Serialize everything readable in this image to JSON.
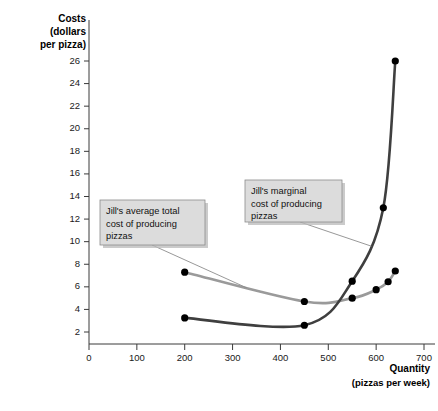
{
  "chart_data": {
    "type": "line",
    "title": "",
    "ylabel": "Costs (dollars per pizza)",
    "ylabel_lines": [
      "Costs",
      "(dollars",
      "per pizza)"
    ],
    "xlabel": "Quantity (pizzas per week)",
    "xlabel_lines": [
      "Quantity",
      "(pizzas per week)"
    ],
    "xlim": [
      0,
      700
    ],
    "ylim": [
      0,
      27
    ],
    "xticks": [
      0,
      100,
      200,
      300,
      400,
      500,
      600,
      700
    ],
    "yticks": [
      2,
      4,
      6,
      8,
      10,
      12,
      14,
      16,
      18,
      20,
      22,
      24,
      26
    ],
    "grid": false,
    "legend": "none",
    "series": [
      {
        "name": "Jill's average total cost of producing pizzas",
        "key": "atc",
        "color": "#9a9a9a",
        "x": [
          200,
          450,
          550,
          600,
          625,
          640
        ],
        "values": [
          7.3,
          4.7,
          5.0,
          5.75,
          6.45,
          7.4
        ]
      },
      {
        "name": "Jill's marginal cost of producing pizzas",
        "key": "mc",
        "color": "#3f3f3f",
        "x": [
          200,
          450,
          550,
          615,
          640
        ],
        "values": [
          3.25,
          2.6,
          6.5,
          13.0,
          26.0
        ]
      }
    ],
    "annotations": [
      {
        "id": "atc-callout",
        "lines": [
          "Jill's average total",
          "cost of producing",
          "pizzas"
        ],
        "target_x": 330,
        "target_y": 5.9
      },
      {
        "id": "mc-callout",
        "lines": [
          "Jill's marginal",
          "cost of producing",
          "pizzas"
        ],
        "target_x": 590,
        "target_y": 9.6
      }
    ]
  }
}
